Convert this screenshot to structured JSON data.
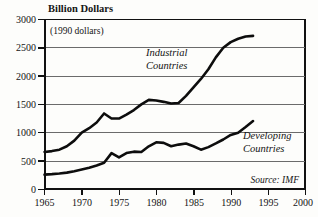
{
  "chart_data": {
    "type": "line",
    "title": "Billion Dollars",
    "annotation": "(1990 dollars)",
    "source": "Source: IMF",
    "xlabel": "",
    "ylabel": "Billion Dollars",
    "xlim": [
      1965,
      2000
    ],
    "ylim": [
      0,
      3000
    ],
    "xticks": [
      1965,
      1970,
      1975,
      1980,
      1985,
      1990,
      1995,
      2000
    ],
    "yticks": [
      0,
      500,
      1000,
      1500,
      2000,
      2500,
      3000
    ],
    "grid": true,
    "legend_position": "inline-annotations",
    "series": [
      {
        "name": "Industrial Countries",
        "label_x": 1977.5,
        "label_y": 2300,
        "x": [
          1965,
          1966,
          1967,
          1968,
          1969,
          1970,
          1971,
          1972,
          1973,
          1974,
          1975,
          1976,
          1977,
          1978,
          1979,
          1980,
          1981,
          1982,
          1983,
          1984,
          1985,
          1986,
          1987,
          1988,
          1989,
          1990,
          1991,
          1992,
          1993
        ],
        "values": [
          660,
          675,
          700,
          760,
          860,
          1000,
          1080,
          1180,
          1340,
          1250,
          1250,
          1320,
          1400,
          1500,
          1580,
          1570,
          1545,
          1515,
          1525,
          1650,
          1800,
          1950,
          2120,
          2330,
          2500,
          2600,
          2660,
          2700,
          2710
        ]
      },
      {
        "name": "Developing Countries",
        "label_x": 1992.5,
        "label_y": 1010,
        "x": [
          1965,
          1966,
          1967,
          1968,
          1969,
          1970,
          1971,
          1972,
          1973,
          1974,
          1975,
          1976,
          1977,
          1978,
          1979,
          1980,
          1981,
          1982,
          1983,
          1984,
          1985,
          1986,
          1987,
          1988,
          1989,
          1990,
          1991,
          1992,
          1993
        ],
        "values": [
          260,
          268,
          280,
          295,
          320,
          350,
          380,
          420,
          470,
          640,
          565,
          640,
          665,
          660,
          760,
          830,
          820,
          760,
          790,
          810,
          760,
          700,
          745,
          810,
          880,
          960,
          1000,
          1100,
          1205
        ]
      }
    ]
  },
  "axis": {
    "y_tick_labels": [
      "3000",
      "2500",
      "2000",
      "1500",
      "1000",
      "500",
      "0"
    ],
    "x_tick_labels": [
      "1965",
      "1970",
      "1975",
      "1980",
      "1985",
      "1990",
      "1995",
      "2000"
    ]
  },
  "labels": {
    "title": "Billion Dollars",
    "annotation": "(1990 dollars)",
    "industrial_line1": "Industrial",
    "industrial_line2": "Countries",
    "developing_line1": "Developing",
    "developing_line2": "Countries",
    "source": "Source: IMF"
  }
}
